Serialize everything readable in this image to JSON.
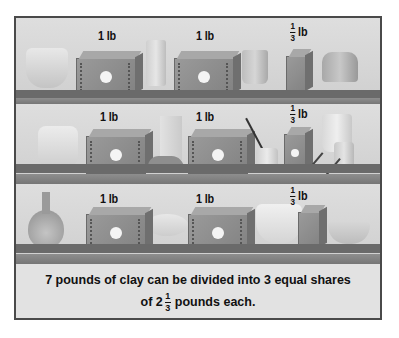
{
  "figure": {
    "shelves": [
      {
        "labels": [
          {
            "text": "1 lb",
            "whole": "1",
            "unit": "lb"
          },
          {
            "text": "1 lb",
            "whole": "1",
            "unit": "lb"
          },
          {
            "text": "1/3 lb",
            "numerator": "1",
            "denominator": "3",
            "unit": "lb"
          }
        ],
        "objects": [
          "wavy-rim-bowl",
          "clay-block",
          "tall-cup",
          "clay-block",
          "pitcher",
          "small-clay-block",
          "flared-pot"
        ]
      },
      {
        "labels": [
          {
            "text": "1 lb",
            "whole": "1",
            "unit": "lb"
          },
          {
            "text": "1 lb",
            "whole": "1",
            "unit": "lb"
          },
          {
            "text": "1/3 lb",
            "numerator": "1",
            "denominator": "3",
            "unit": "lb"
          }
        ],
        "objects": [
          "measuring-pitcher",
          "clay-block",
          "tall-block",
          "clay-lump",
          "clay-block",
          "paint-jar-with-brush",
          "small-clay-block",
          "large-cup",
          "small-jar",
          "sculpting-tools"
        ]
      },
      {
        "labels": [
          {
            "text": "1 lb",
            "whole": "1",
            "unit": "lb"
          },
          {
            "text": "1 lb",
            "whole": "1",
            "unit": "lb"
          },
          {
            "text": "1/3 lb",
            "numerator": "1",
            "denominator": "3",
            "unit": "lb"
          }
        ],
        "objects": [
          "bottle-vase",
          "clay-block",
          "shallow-dish",
          "clay-block",
          "decorated-bowl",
          "small-clay-block",
          "small-bowl"
        ]
      }
    ],
    "caption": {
      "line1": "7 pounds of clay can be divided into 3 equal shares",
      "line2_prefix": "of 2",
      "line2_numerator": "1",
      "line2_denominator": "3",
      "line2_suffix": "pounds each."
    }
  }
}
